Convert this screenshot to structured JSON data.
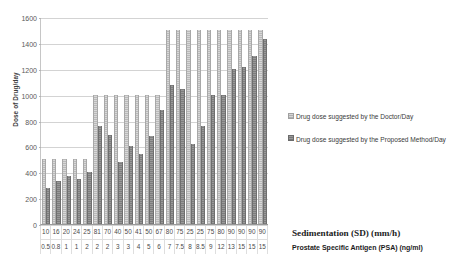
{
  "chart_data": {
    "type": "bar",
    "title": "",
    "xlabel": "Sedimentation (SD) (mm/h) / Prostate Specific Antigen (PSA) (ng/ml)",
    "ylabel": "Dose of Drug/day",
    "ylim": [
      0,
      1600
    ],
    "yticks": [
      0,
      200,
      400,
      600,
      800,
      1000,
      1200,
      1400,
      1600
    ],
    "grid": true,
    "legend_position": "right",
    "categories": [
      "10 / 0.5",
      "16 / 0.8",
      "20 / 1",
      "24 / 1",
      "25 / 2",
      "81 / 2",
      "70 / 2",
      "40 / 3",
      "50 / 3",
      "41 / 4",
      "50 / 5",
      "67 / 6",
      "80 / 7",
      "75 / 7.5",
      "25 / 8",
      "25 / 8.5",
      "75 / 9",
      "80 / 12",
      "90 / 13",
      "90 / 15",
      "90 / 15",
      "90 / 15"
    ],
    "sedimentation_values": [
      "10",
      "16",
      "20",
      "24",
      "25",
      "81",
      "70",
      "40",
      "50",
      "41",
      "50",
      "67",
      "80",
      "75",
      "25",
      "25",
      "75",
      "80",
      "90",
      "90",
      "90",
      "90"
    ],
    "psa_values": [
      "0.5",
      "0.8",
      "1",
      "1",
      "2",
      "2",
      "2",
      "3",
      "3",
      "4",
      "5",
      "6",
      "7",
      "7.5",
      "8",
      "8.5",
      "9",
      "12",
      "13",
      "15",
      "15",
      "15"
    ],
    "series": [
      {
        "name": "Drug dose suggested by the Doctor/Day",
        "color": "#c9c9c9",
        "values": [
          500,
          500,
          500,
          500,
          500,
          1000,
          1000,
          1000,
          1000,
          1000,
          1000,
          1000,
          1500,
          1500,
          1500,
          1500,
          1500,
          1500,
          1500,
          1500,
          1500,
          1500
        ]
      },
      {
        "name": "Drug dose suggested by the Proposed Method/Day",
        "color": "#8a8a8a",
        "values": [
          280,
          330,
          370,
          350,
          400,
          760,
          690,
          480,
          600,
          545,
          680,
          880,
          1075,
          1040,
          620,
          760,
          1000,
          1000,
          1200,
          1210,
          1300,
          1430
        ]
      }
    ]
  },
  "axis": {
    "y_title": "Dose of Drug/day",
    "caption_sd": "Sedimentation (SD) (mm/h)",
    "caption_psa": "Prostate Specific Antigen (PSA) (ng/ml)"
  },
  "legend": {
    "items": [
      {
        "label": "Drug dose suggested by the Doctor/Day"
      },
      {
        "label": "Drug dose suggested by the Proposed Method/Day"
      }
    ]
  }
}
